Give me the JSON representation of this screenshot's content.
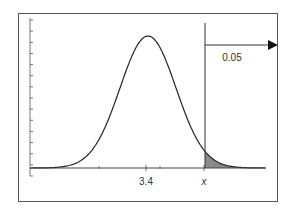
{
  "chart_data": {
    "type": "area",
    "title": "",
    "xlabel": "",
    "ylabel": "",
    "x_tick_labels": [
      "3.4",
      "x"
    ],
    "mean": 3.4,
    "critical_value_label": "x",
    "tail_area": 0.05,
    "tail_area_label": "0.05",
    "shaded_region": "right tail (x to +infinity)",
    "grid": false,
    "legend": null,
    "y_ticks_count": 14,
    "colors": {
      "curve": "#222222",
      "shade": "#8a8a8a",
      "frame": "#555555"
    }
  },
  "labels": {
    "mean": "3.4",
    "critical": "x",
    "area": "0.05"
  }
}
